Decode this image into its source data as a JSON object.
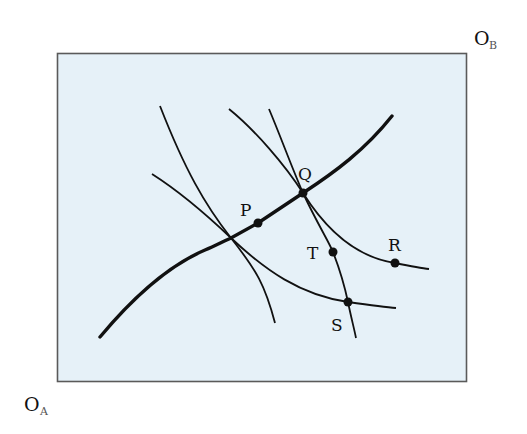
{
  "diagram": {
    "type": "edgeworth-box",
    "colors": {
      "box_fill": "#e6f1f8",
      "box_stroke": "#5a5a5a",
      "curve": "#111111"
    },
    "origins": {
      "A": {
        "letter": "O",
        "subscript": "A"
      },
      "B": {
        "letter": "O",
        "subscript": "B"
      }
    },
    "points": [
      {
        "id": "P",
        "label": "P"
      },
      {
        "id": "Q",
        "label": "Q"
      },
      {
        "id": "R",
        "label": "R"
      },
      {
        "id": "S",
        "label": "S"
      },
      {
        "id": "T",
        "label": "T"
      }
    ],
    "curves": {
      "contract_curve": "contract-curve",
      "indifference_count": 5
    }
  }
}
